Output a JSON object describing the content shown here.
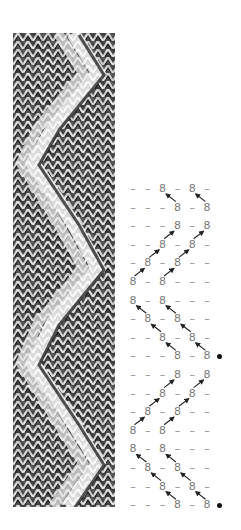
{
  "figure": {
    "photo": {
      "description": "knitted zigzag cable swatch photograph",
      "tone": "grayscale"
    },
    "chart": {
      "symbols": {
        "purl": "–",
        "cable_stitch": "8",
        "row_marker": "•"
      },
      "columns": 6,
      "rows": [
        {
          "cells": [
            "-",
            "-",
            "8",
            "-",
            "8",
            "-"
          ],
          "marker": false
        },
        {
          "cells": [
            "-",
            "-",
            "-",
            "8",
            "-",
            "8"
          ],
          "marker": false
        },
        {
          "cells": [
            "-",
            "-",
            "-",
            "8",
            "-",
            "8"
          ],
          "marker": false
        },
        {
          "cells": [
            "-",
            "-",
            "8",
            "-",
            "8",
            "-"
          ],
          "marker": false
        },
        {
          "cells": [
            "-",
            "8",
            "-",
            "8",
            "-",
            "-"
          ],
          "marker": false
        },
        {
          "cells": [
            "8",
            "-",
            "8",
            "-",
            "-",
            "-"
          ],
          "marker": false
        },
        {
          "cells": [
            "8",
            "-",
            "8",
            "-",
            "-",
            "-"
          ],
          "marker": false
        },
        {
          "cells": [
            "-",
            "8",
            "-",
            "8",
            "-",
            "-"
          ],
          "marker": false
        },
        {
          "cells": [
            "-",
            "-",
            "8",
            "-",
            "8",
            "-"
          ],
          "marker": false
        },
        {
          "cells": [
            "-",
            "-",
            "-",
            "8",
            "-",
            "8"
          ],
          "marker": true
        },
        {
          "cells": [
            "-",
            "-",
            "-",
            "8",
            "-",
            "8"
          ],
          "marker": false
        },
        {
          "cells": [
            "-",
            "-",
            "8",
            "-",
            "8",
            "-"
          ],
          "marker": false
        },
        {
          "cells": [
            "-",
            "8",
            "-",
            "8",
            "-",
            "-"
          ],
          "marker": false
        },
        {
          "cells": [
            "8",
            "-",
            "8",
            "-",
            "-",
            "-"
          ],
          "marker": false
        },
        {
          "cells": [
            "8",
            "-",
            "8",
            "-",
            "-",
            "-"
          ],
          "marker": false
        },
        {
          "cells": [
            "-",
            "8",
            "-",
            "8",
            "-",
            "-"
          ],
          "marker": false
        },
        {
          "cells": [
            "-",
            "-",
            "8",
            "-",
            "8",
            "-"
          ],
          "marker": false
        },
        {
          "cells": [
            "-",
            "-",
            "-",
            "8",
            "-",
            "8"
          ],
          "marker": true
        }
      ],
      "colors": {
        "symbol": "#7a7a7a",
        "arrow": "#222222",
        "marker": "#111111"
      }
    }
  }
}
